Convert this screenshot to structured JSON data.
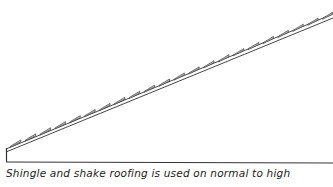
{
  "diagram": {
    "line_color": "#333333",
    "shingle_fill": "#bbbbbb",
    "roof": {
      "x1": 6,
      "y1": 148,
      "x2": 333,
      "y2": 14
    },
    "shingle_count": 22
  },
  "caption": "Shingle and shake roofing is used on normal to high"
}
